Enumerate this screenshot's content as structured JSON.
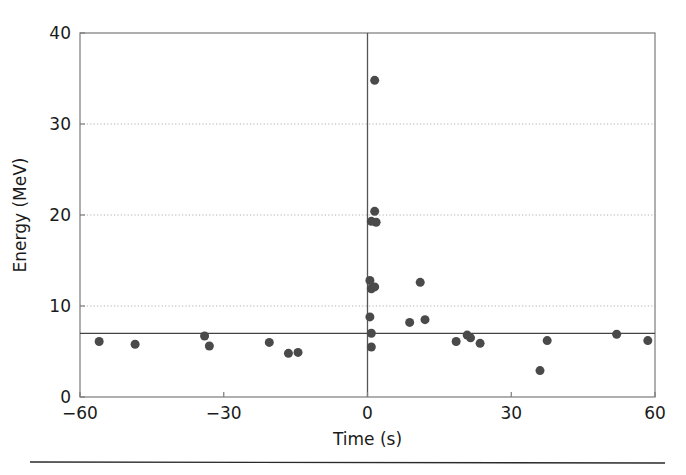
{
  "figure": {
    "background_color": "#ffffff",
    "caption_rule": true
  },
  "chart_data": {
    "type": "scatter",
    "title": "",
    "xlabel": "Time (s)",
    "ylabel": "Energy (MeV)",
    "xlim": [
      -60,
      60
    ],
    "ylim": [
      0,
      40
    ],
    "xticks": [
      -60,
      -30,
      0,
      30,
      60
    ],
    "xtick_labels": [
      "−60",
      "−30",
      "0",
      "30",
      "60"
    ],
    "yticks": [
      0,
      10,
      20,
      30,
      40
    ],
    "ytick_labels": [
      "0",
      "10",
      "20",
      "30",
      "40"
    ],
    "grid": {
      "horizontal_gridlines": [
        10,
        20,
        30
      ],
      "style": "dotted",
      "color": "#b0b0b0"
    },
    "reference_lines": [
      {
        "orientation": "vertical",
        "value": 0,
        "color": "#555555",
        "style": "solid"
      },
      {
        "orientation": "horizontal",
        "value": 7.0,
        "color": "#444444",
        "style": "solid"
      }
    ],
    "marker": {
      "shape": "circle",
      "color": "#4a4a4a",
      "size": 9
    },
    "points": [
      {
        "x": -56.0,
        "y": 6.1
      },
      {
        "x": -48.5,
        "y": 5.8
      },
      {
        "x": -34.0,
        "y": 6.7
      },
      {
        "x": -33.0,
        "y": 5.6
      },
      {
        "x": -20.5,
        "y": 6.0
      },
      {
        "x": -16.5,
        "y": 4.8
      },
      {
        "x": -14.5,
        "y": 4.9
      },
      {
        "x": 1.5,
        "y": 34.8
      },
      {
        "x": 1.5,
        "y": 20.4
      },
      {
        "x": 0.8,
        "y": 19.3
      },
      {
        "x": 1.8,
        "y": 19.2
      },
      {
        "x": 0.5,
        "y": 12.8
      },
      {
        "x": 1.5,
        "y": 12.1
      },
      {
        "x": 0.8,
        "y": 11.9
      },
      {
        "x": 0.5,
        "y": 8.8
      },
      {
        "x": 0.8,
        "y": 7.0
      },
      {
        "x": 0.8,
        "y": 5.5
      },
      {
        "x": 11.0,
        "y": 12.6
      },
      {
        "x": 8.8,
        "y": 8.2
      },
      {
        "x": 12.0,
        "y": 8.5
      },
      {
        "x": 18.5,
        "y": 6.1
      },
      {
        "x": 20.8,
        "y": 6.8
      },
      {
        "x": 21.5,
        "y": 6.5
      },
      {
        "x": 23.5,
        "y": 5.9
      },
      {
        "x": 36.0,
        "y": 2.9
      },
      {
        "x": 37.5,
        "y": 6.2
      },
      {
        "x": 52.0,
        "y": 6.9
      },
      {
        "x": 58.5,
        "y": 6.2
      }
    ]
  }
}
